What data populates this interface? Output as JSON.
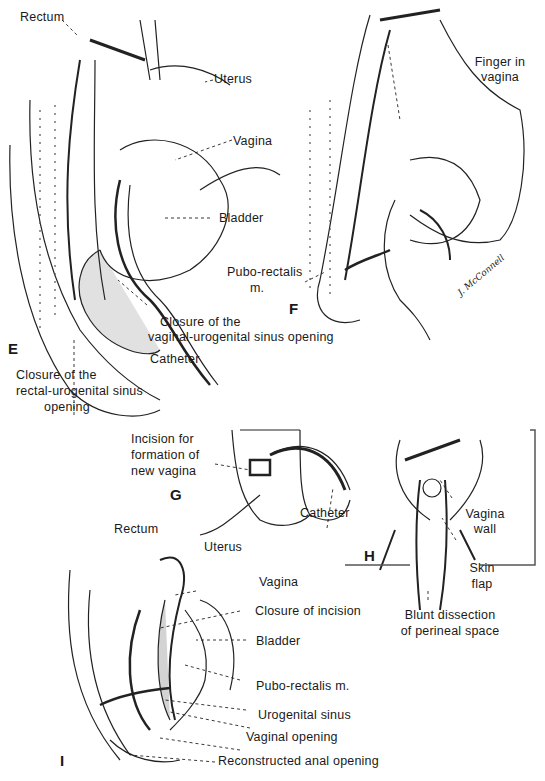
{
  "figure": {
    "panels": [
      {
        "id": "E",
        "letter": "E",
        "labels": [
          "Rectum",
          "Uterus",
          "Vagina",
          "Bladder",
          "Closure of the",
          "vaginal-urogenital sinus opening",
          "Catheter",
          "Closure of the",
          "rectal-urogenital sinus",
          "opening"
        ]
      },
      {
        "id": "F",
        "letter": "F",
        "labels": [
          "Finger in",
          "vagina",
          "Pubo-rectalis",
          "m."
        ]
      },
      {
        "id": "G",
        "letter": "G",
        "labels": [
          "Incision for",
          "formation of",
          "new vagina",
          "Catheter"
        ]
      },
      {
        "id": "H",
        "letter": "H",
        "labels": [
          "Vagina",
          "wall",
          "Skin",
          "flap",
          "Blunt dissection",
          "of perineal space"
        ]
      },
      {
        "id": "I",
        "letter": "I",
        "labels": [
          "Rectum",
          "Uterus",
          "Vagina",
          "Closure of incision",
          "Bladder",
          "Pubo-rectalis m.",
          "Urogenital sinus",
          "Vaginal opening",
          "Reconstructed anal opening"
        ]
      }
    ],
    "signature": "J. McConnell"
  }
}
